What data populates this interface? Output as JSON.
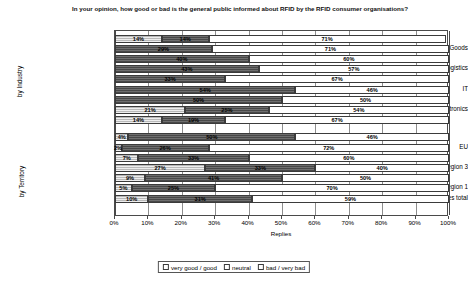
{
  "chart_data": {
    "type": "bar",
    "subtype": "stacked-horizontal-100",
    "title": "In your opinion, how good or bad is the general public informed about RFID by the RFID consumer organisations?",
    "xlabel": "Replies",
    "ylabel": "",
    "xlim": [
      0,
      100
    ],
    "xunit": "%",
    "grid": true,
    "legend_position": "bottom",
    "xticks": [
      "0%",
      "10%",
      "20%",
      "30%",
      "40%",
      "50%",
      "60%",
      "70%",
      "80%",
      "90%",
      "100%"
    ],
    "xtick_values": [
      0,
      10,
      20,
      30,
      40,
      50,
      60,
      70,
      80,
      90,
      100
    ],
    "legend": [
      "very good / good",
      "neutral",
      "bad / very bad"
    ],
    "series": [
      {
        "name": "very good / good",
        "key": "good"
      },
      {
        "name": "neutral",
        "key": "neutral"
      },
      {
        "name": "bad / very bad",
        "key": "bad"
      }
    ],
    "group_labels": [
      "by Industry",
      "by Territory"
    ],
    "groups": [
      {
        "name": "by Industry",
        "rows": [
          {
            "label": "",
            "good": 14,
            "neutral": 14,
            "bad": 71
          },
          {
            "label": "Retail / Consumer Goods",
            "good": 0,
            "neutral": 29,
            "bad": 71
          },
          {
            "label": "",
            "good": 0,
            "neutral": 40,
            "bad": 60
          },
          {
            "label": "Packaging / Logistics",
            "good": 0,
            "neutral": 43,
            "bad": 57
          },
          {
            "label": "",
            "good": 0,
            "neutral": 33,
            "bad": 67
          },
          {
            "label": "IT",
            "good": 0,
            "neutral": 54,
            "bad": 46
          },
          {
            "label": "",
            "good": 0,
            "neutral": 50,
            "bad": 50
          },
          {
            "label": "Electronics",
            "good": 21,
            "neutral": 25,
            "bad": 54
          },
          {
            "label": "",
            "good": 14,
            "neutral": 19,
            "bad": 67
          }
        ]
      },
      {
        "name": "by Territory",
        "rows": [
          {
            "label": "",
            "good": 4,
            "neutral": 50,
            "bad": 46
          },
          {
            "label": "EU",
            "good": 2,
            "neutral": 26,
            "bad": 72
          },
          {
            "label": "",
            "good": 7,
            "neutral": 33,
            "bad": 60
          },
          {
            "label": "ITU region 3",
            "good": 27,
            "neutral": 33,
            "bad": 40
          },
          {
            "label": "",
            "good": 9,
            "neutral": 41,
            "bad": 50
          },
          {
            "label": "ITU region 1",
            "good": 5,
            "neutral": 25,
            "bad": 70
          },
          {
            "label": "Replies total",
            "good": 10,
            "neutral": 31,
            "bad": 59
          }
        ]
      }
    ]
  }
}
